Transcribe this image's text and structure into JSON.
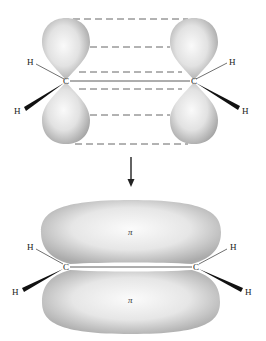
{
  "diagram": {
    "top_panel": {
      "description": "Two parallel unhybridized p orbitals on sp2 carbons",
      "carbons": [
        {
          "label": "C",
          "x": 66,
          "y": 81
        },
        {
          "label": "C",
          "x": 194,
          "y": 81
        }
      ],
      "hydrogens": [
        {
          "label": "H",
          "x": 30,
          "y": 64
        },
        {
          "label": "H",
          "x": 17,
          "y": 113
        },
        {
          "label": "H",
          "x": 233,
          "y": 64
        },
        {
          "label": "H",
          "x": 245,
          "y": 113
        }
      ],
      "dashed_line_ys": [
        19,
        47,
        72,
        89,
        115,
        144
      ]
    },
    "arrow": {
      "direction": "down"
    },
    "bottom_panel": {
      "description": "Pi molecular orbital above and below the C–C axis",
      "carbons": [
        {
          "label": "C",
          "x": 66,
          "y": 266
        },
        {
          "label": "C",
          "x": 196,
          "y": 266
        }
      ],
      "hydrogens": [
        {
          "label": "H",
          "x": 30,
          "y": 249
        },
        {
          "label": "H",
          "x": 15,
          "y": 293
        },
        {
          "label": "H",
          "x": 233,
          "y": 249
        },
        {
          "label": "H",
          "x": 248,
          "y": 293
        }
      ],
      "pi_labels": [
        "π",
        "π"
      ]
    },
    "colors": {
      "orbital_light": "#f4f4f4",
      "orbital_dark": "#a8a8a8",
      "line": "#333333",
      "dash": "#555555"
    }
  }
}
